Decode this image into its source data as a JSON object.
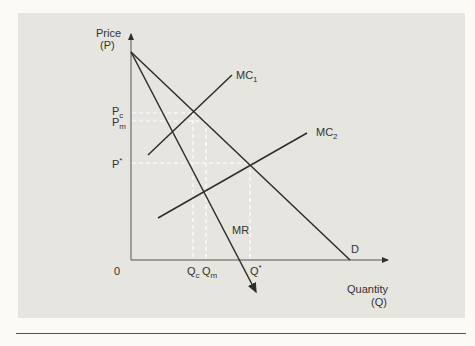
{
  "diagram": {
    "y_axis_label": "Price",
    "y_axis_symbol": "(P)",
    "x_axis_label": "Quantity",
    "x_axis_symbol": "(Q)",
    "origin_label": "0",
    "curves": {
      "mc1": {
        "base": "MC",
        "sub": "1"
      },
      "mc2": {
        "base": "MC",
        "sub": "2"
      },
      "mr": "MR",
      "demand": "D"
    },
    "price_ticks": {
      "pc": {
        "base": "P",
        "sub": "c"
      },
      "pm": {
        "base": "P",
        "sub": "m"
      },
      "pstar": {
        "base": "P",
        "sup": "*"
      }
    },
    "quantity_ticks": {
      "qc": {
        "base": "Q",
        "sub": "c"
      },
      "qm": {
        "base": "Q",
        "sub": "m"
      },
      "qstar": {
        "base": "Q",
        "sup": "*"
      }
    },
    "colors": {
      "panel": "#e6e5df",
      "line": "#2e2e2a",
      "guide": "#ffffff",
      "page": "#fbfaf4"
    }
  }
}
